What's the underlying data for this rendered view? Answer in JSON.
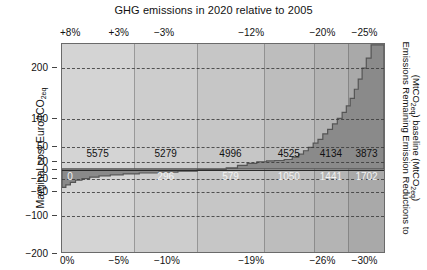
{
  "chart_data": {
    "type": "area",
    "title": "GHG emissions in 2020 relative to 2005",
    "xlabel": "",
    "ylabel": "Marginal cost Euro/tCO2eq",
    "right_axis_label_line1": "Emissions Remaining Emission Reductions to",
    "right_axis_label_line2": "(MtCO2eq) baseline (MtCO2eq)",
    "ylim": [
      -200,
      260
    ],
    "xlim": [
      0,
      100
    ],
    "grid": true,
    "legend": "none",
    "y_ticks": [
      {
        "value": 200,
        "label": "200"
      },
      {
        "value": 100,
        "label": "100"
      },
      {
        "value": 50,
        "label": "50"
      },
      {
        "value": 20,
        "label": "20"
      },
      {
        "value": 0,
        "label": "0"
      },
      {
        "value": -20,
        "label": "−20"
      },
      {
        "value": -50,
        "label": "−50"
      },
      {
        "value": -100,
        "label": "−100"
      },
      {
        "value": -200,
        "label": "−200"
      }
    ],
    "x_ticks_bottom": [
      {
        "pos": 0,
        "label": "0%"
      },
      {
        "pos": 15,
        "label": "−5%"
      },
      {
        "pos": 29,
        "label": "−10%"
      },
      {
        "pos": 55,
        "label": "−19%"
      },
      {
        "pos": 77,
        "label": "−26%"
      },
      {
        "pos": 90,
        "label": "−30%"
      }
    ],
    "x_ticks_top": [
      {
        "pos": 0,
        "label": "+8%"
      },
      {
        "pos": 15,
        "label": "+3%"
      },
      {
        "pos": 29,
        "label": "−3%"
      },
      {
        "pos": 55,
        "label": "−12%"
      },
      {
        "pos": 77,
        "label": "−20%"
      },
      {
        "pos": 90,
        "label": "−25%"
      }
    ],
    "band_boundaries": [
      0,
      22.2,
      41.7,
      62.3,
      77.8,
      88.3,
      100
    ],
    "band_colors": [
      "#d4d4d4",
      "#cdcdcd",
      "#c6c6c6",
      "#bdbdbd",
      "#b4b4b4",
      "#a9a9a9"
    ],
    "curve_fill_color": "#8a8a8a",
    "remaining_emissions_labels": [
      {
        "pos": 11,
        "value": 5575,
        "text": "5575"
      },
      {
        "pos": 32,
        "value": 5279,
        "text": "5279"
      },
      {
        "pos": 52,
        "value": 4996,
        "text": "4996"
      },
      {
        "pos": 70,
        "value": 4525,
        "text": "4525"
      },
      {
        "pos": 83,
        "value": 4134,
        "text": "4134"
      },
      {
        "pos": 94,
        "value": 3873,
        "text": "3873"
      }
    ],
    "emission_reductions_labels": [
      {
        "pos": 2.5,
        "value": 0,
        "text": "0"
      },
      {
        "pos": 32,
        "value": 296,
        "text": "296"
      },
      {
        "pos": 52,
        "value": 579,
        "text": "579"
      },
      {
        "pos": 70,
        "value": 1050,
        "text": "1050"
      },
      {
        "pos": 83,
        "value": 1441,
        "text": "1441"
      },
      {
        "pos": 94,
        "value": 1702,
        "text": "1702"
      }
    ],
    "steps": [
      {
        "x0": 0.0,
        "x1": 1.2,
        "y": -42
      },
      {
        "x0": 1.2,
        "x1": 2.6,
        "y": -36
      },
      {
        "x0": 2.6,
        "x1": 4.2,
        "y": -30
      },
      {
        "x0": 4.2,
        "x1": 6.2,
        "y": -25
      },
      {
        "x0": 6.2,
        "x1": 8.6,
        "y": -21
      },
      {
        "x0": 8.6,
        "x1": 11.5,
        "y": -18
      },
      {
        "x0": 11.5,
        "x1": 15.0,
        "y": -15
      },
      {
        "x0": 15.0,
        "x1": 19.0,
        "y": -13
      },
      {
        "x0": 19.0,
        "x1": 24.0,
        "y": -11
      },
      {
        "x0": 24.0,
        "x1": 30.0,
        "y": -9
      },
      {
        "x0": 30.0,
        "x1": 36.0,
        "y": -7
      },
      {
        "x0": 36.0,
        "x1": 42.0,
        "y": -5
      },
      {
        "x0": 42.0,
        "x1": 47.0,
        "y": -3
      },
      {
        "x0": 47.0,
        "x1": 51.0,
        "y": -1
      },
      {
        "x0": 51.0,
        "x1": 54.5,
        "y": 2
      },
      {
        "x0": 54.5,
        "x1": 57.5,
        "y": 8
      },
      {
        "x0": 57.5,
        "x1": 60.5,
        "y": 13
      },
      {
        "x0": 60.5,
        "x1": 63.5,
        "y": 17
      },
      {
        "x0": 63.5,
        "x1": 66.0,
        "y": 19
      },
      {
        "x0": 66.0,
        "x1": 69.0,
        "y": 20
      },
      {
        "x0": 69.0,
        "x1": 71.5,
        "y": 22
      },
      {
        "x0": 71.5,
        "x1": 73.5,
        "y": 27
      },
      {
        "x0": 73.5,
        "x1": 75.0,
        "y": 33
      },
      {
        "x0": 75.0,
        "x1": 76.5,
        "y": 40
      },
      {
        "x0": 76.5,
        "x1": 78.0,
        "y": 47
      },
      {
        "x0": 78.0,
        "x1": 79.5,
        "y": 55
      },
      {
        "x0": 79.5,
        "x1": 81.0,
        "y": 62
      },
      {
        "x0": 81.0,
        "x1": 82.5,
        "y": 72
      },
      {
        "x0": 82.5,
        "x1": 84.0,
        "y": 80
      },
      {
        "x0": 84.0,
        "x1": 85.5,
        "y": 90
      },
      {
        "x0": 85.5,
        "x1": 87.0,
        "y": 100
      },
      {
        "x0": 87.0,
        "x1": 88.3,
        "y": 112
      },
      {
        "x0": 88.3,
        "x1": 89.5,
        "y": 125
      },
      {
        "x0": 89.5,
        "x1": 90.8,
        "y": 140
      },
      {
        "x0": 90.8,
        "x1": 92.0,
        "y": 158
      },
      {
        "x0": 92.0,
        "x1": 93.2,
        "y": 178
      },
      {
        "x0": 93.2,
        "x1": 94.5,
        "y": 200
      },
      {
        "x0": 94.5,
        "x1": 96.0,
        "y": 225
      },
      {
        "x0": 96.0,
        "x1": 100.0,
        "y": 258
      }
    ]
  }
}
